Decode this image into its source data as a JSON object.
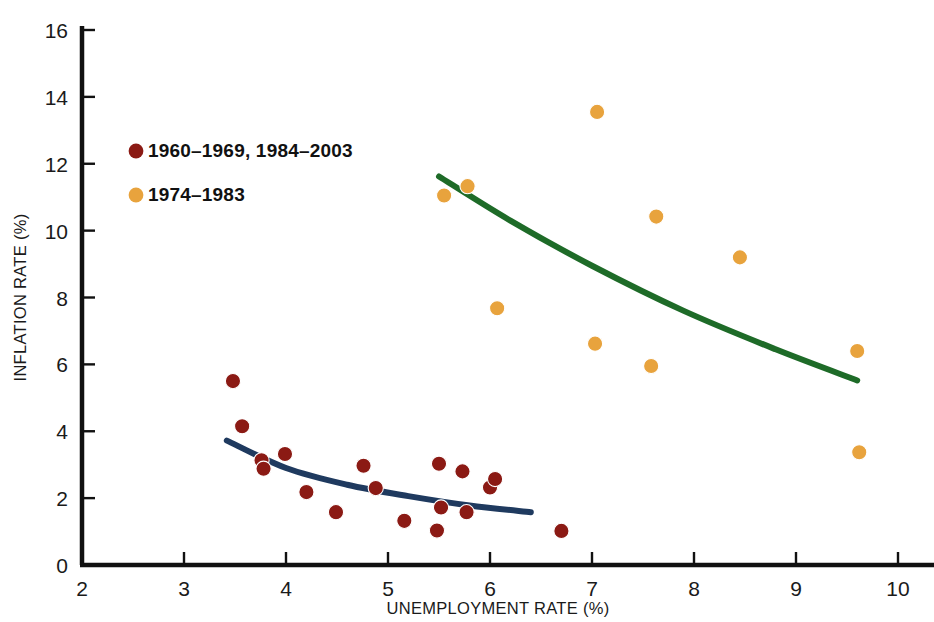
{
  "chart_data": {
    "type": "scatter",
    "title": "",
    "xlabel": "UNEMPLOYMENT RATE (%)",
    "ylabel": "INFLATION RATE (%)",
    "xlim": [
      2,
      10
    ],
    "ylim": [
      0,
      16
    ],
    "xticks": [
      "2",
      "3",
      "4",
      "5",
      "6",
      "7",
      "8",
      "9",
      "10"
    ],
    "yticks": [
      "0",
      "2",
      "4",
      "6",
      "8",
      "10",
      "12",
      "14",
      "16"
    ],
    "grid": false,
    "legend_position": "upper-left",
    "colors": {
      "series_1": "#8B1A14",
      "series_2": "#E8A33D",
      "fit_1": "#1F3A5F",
      "fit_2": "#1E6B28",
      "axis": "#111111",
      "text": "#1a1a1a",
      "background": "#ffffff"
    },
    "series": [
      {
        "name": "1960–1969, 1984–2003",
        "color": "#8B1A14",
        "points": [
          [
            3.48,
            5.5
          ],
          [
            3.57,
            4.15
          ],
          [
            3.76,
            3.13
          ],
          [
            3.78,
            2.88
          ],
          [
            3.99,
            3.32
          ],
          [
            4.2,
            2.18
          ],
          [
            4.49,
            1.58
          ],
          [
            4.76,
            2.97
          ],
          [
            4.88,
            2.3
          ],
          [
            5.16,
            1.32
          ],
          [
            5.48,
            1.03
          ],
          [
            5.5,
            3.03
          ],
          [
            5.52,
            1.72
          ],
          [
            5.73,
            2.8
          ],
          [
            5.77,
            1.58
          ],
          [
            6.0,
            2.32
          ],
          [
            6.05,
            2.57
          ],
          [
            6.7,
            1.02
          ]
        ]
      },
      {
        "name": "1974–1983",
        "color": "#E8A33D",
        "points": [
          [
            5.55,
            11.05
          ],
          [
            5.78,
            11.33
          ],
          [
            6.07,
            7.68
          ],
          [
            7.03,
            6.62
          ],
          [
            7.05,
            13.55
          ],
          [
            7.58,
            5.95
          ],
          [
            7.63,
            10.42
          ],
          [
            8.45,
            9.2
          ],
          [
            9.6,
            6.4
          ],
          [
            9.62,
            3.37
          ]
        ]
      }
    ],
    "fit_curves": [
      {
        "name": "short-run Phillips curve 1960s/1984-2003",
        "color": "#1F3A5F",
        "path": [
          [
            3.42,
            3.72
          ],
          [
            4.0,
            2.9
          ],
          [
            4.6,
            2.4
          ],
          [
            5.2,
            2.06
          ],
          [
            5.8,
            1.78
          ],
          [
            6.4,
            1.58
          ]
        ]
      },
      {
        "name": "short-run Phillips curve 1974-1983",
        "color": "#1E6B28",
        "path": [
          [
            5.5,
            11.62
          ],
          [
            6.2,
            10.3
          ],
          [
            7.0,
            8.95
          ],
          [
            7.9,
            7.6
          ],
          [
            8.8,
            6.45
          ],
          [
            9.6,
            5.52
          ]
        ]
      }
    ],
    "legend": [
      {
        "label": "1960–1969, 1984–2003",
        "marker_color": "#8B1A14"
      },
      {
        "label": "1974–1983",
        "marker_color": "#E8A33D"
      }
    ]
  }
}
